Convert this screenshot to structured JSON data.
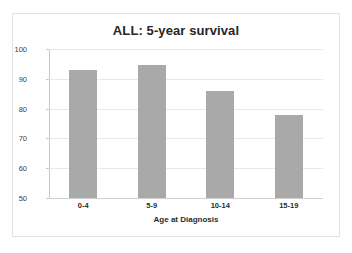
{
  "chart_data": {
    "type": "bar",
    "title": "ALL: 5-year survival",
    "xlabel": "Age at Diagnosis",
    "ylabel": "Percent 5-year survival",
    "categories": [
      "0-4",
      "5-9",
      "10-14",
      "15-19"
    ],
    "values": [
      93,
      94.5,
      86,
      78
    ],
    "ylim": [
      50,
      100
    ],
    "yticks": [
      50,
      60,
      70,
      80,
      90,
      100
    ],
    "ytick_labels": [
      "50",
      "60",
      "70",
      "80",
      "90",
      "100"
    ],
    "grid": true,
    "legend": "none",
    "series": [
      {
        "name": "Percent 5-year survival",
        "values": [
          93,
          94.5,
          86,
          78
        ]
      }
    ],
    "colors": {
      "bar_fill": "#a9a9a9",
      "gridline": "#e8e8e8",
      "axis": "#c8c8c8",
      "text": "#2b2b2b",
      "background": "#ffffff",
      "frame_border": "#e2e2e2"
    }
  }
}
